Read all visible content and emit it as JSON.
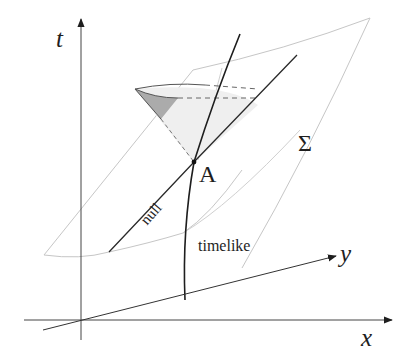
{
  "diagram": {
    "axes": {
      "t_label": "t",
      "x_label": "x",
      "y_label": "y"
    },
    "labels": {
      "point": "A",
      "surface": "Σ",
      "null_curve": "null",
      "timelike_curve": "timelike"
    },
    "colors": {
      "axis": "#333333",
      "curve": "#2a2a2a",
      "surface_edge": "#c4c4c4",
      "cone_shade_dark": "#a9a9a9",
      "cone_shade_light": "#ececec"
    }
  }
}
